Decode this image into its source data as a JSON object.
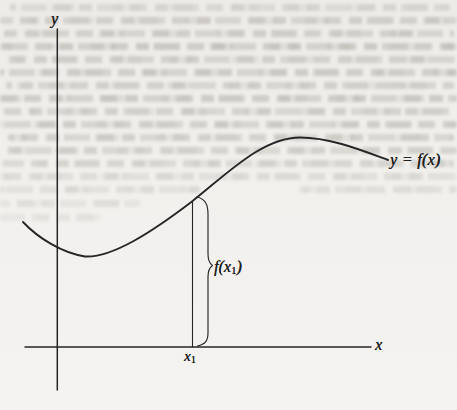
{
  "figure": {
    "axis_labels": {
      "x": "x",
      "y": "y"
    },
    "curve_label": "y = f(x)",
    "value_label": {
      "pre": "f(x",
      "sub": "1",
      "post": ")"
    },
    "point_label": {
      "base": "x",
      "sub": "1"
    },
    "colors": {
      "background": "#f1f0ed",
      "line": "#262626",
      "text": "#1d1d1d"
    },
    "geometry": {
      "y_axis_path": "M 57.3 29 L 57.3 390",
      "x_axis_path": "M 25 347 L 371 347",
      "curve_path": "M 23 222 C 38 238 62 253 85 256.5 C 112 258 152 232 192 201.5 C 229 172 263 137.5 300 137.5 C 330 137.5 361 150 388 160",
      "ordinate_line_path": "M 192.5 202 L 192.5 347",
      "brace_path": "M 197 197 C 205 199 208 204 208 214 L 208 254 C 208 260 209.5 263.5 212.5 265.5 C 209.5 267.5 208 271 208 277 L 208 333 C 208 341 205 344.5 197.5 346"
    }
  }
}
